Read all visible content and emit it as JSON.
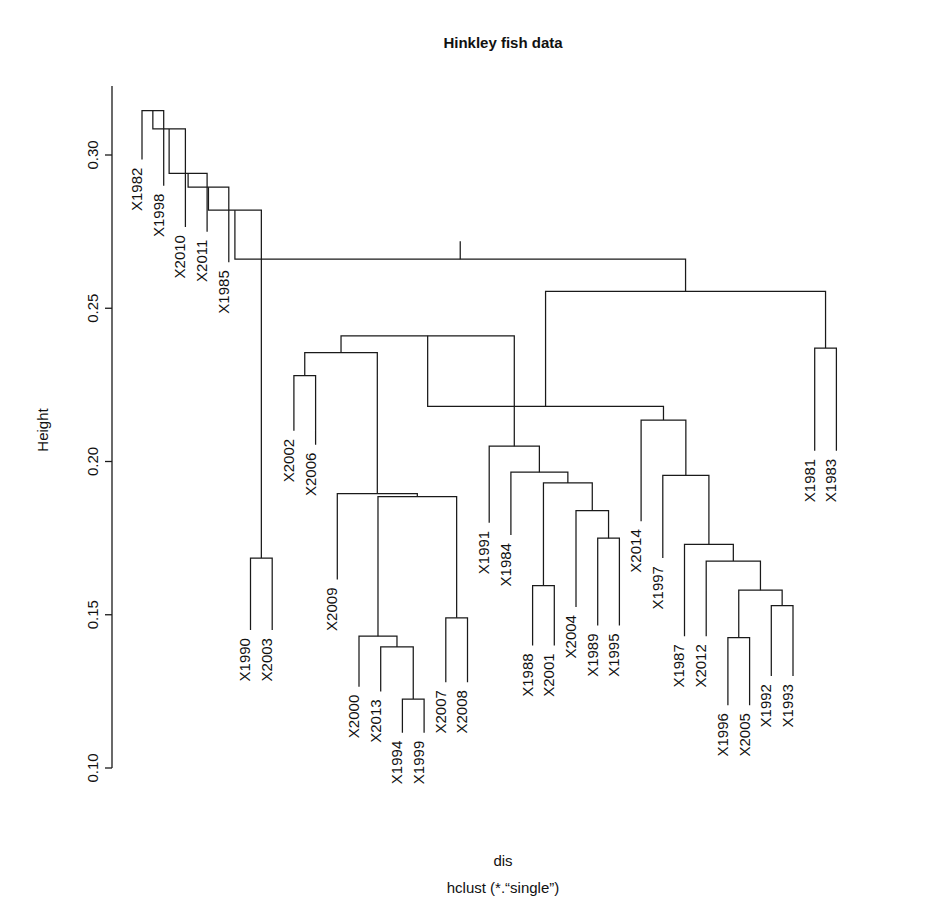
{
  "figure": {
    "title": "Hinkley fish data",
    "ylabel": "Height",
    "caption_line1": "dis",
    "caption_line2": "hclust (*.“single”)",
    "line_color": "#1a1a1a",
    "background": "#ffffff"
  },
  "chart_data": {
    "type": "dendrogram",
    "title": "Hinkley fish data",
    "xlabel": "dis",
    "ylabel": "Height",
    "subtitle": "hclust (*.“single”)",
    "method": "single",
    "distance_object": "dis",
    "grid": false,
    "legend": null,
    "ylim": [
      0.095,
      0.325
    ],
    "yticks": [
      0.1,
      0.15,
      0.2,
      0.25,
      0.3
    ],
    "ytick_labels": [
      "0.10",
      "0.15",
      "0.20",
      "0.25",
      "0.30"
    ],
    "n_leaves": 34,
    "leaf_order": [
      "X1982",
      "X1998",
      "X2010",
      "X2011",
      "X1985",
      "X1990",
      "X2003",
      "X2002",
      "X2006",
      "X2009",
      "X2000",
      "X2013",
      "X1994",
      "X1999",
      "X2007",
      "X2008",
      "X1991",
      "X1984",
      "X1988",
      "X2001",
      "X2004",
      "X1989",
      "X1995",
      "X2014",
      "X1997",
      "X1987",
      "X2012",
      "X1996",
      "X2005",
      "X1992",
      "X1993",
      "X1981",
      "X1983"
    ],
    "leaf_base_height": 0.0,
    "merges": [
      {
        "id": "m1",
        "left": {
          "leaf": "X1982"
        },
        "right": {
          "leaf": "X1998"
        },
        "height": 0.3145
      },
      {
        "id": "m2",
        "left": {
          "node": "m1"
        },
        "right": {
          "leaf": "X2010"
        },
        "height": 0.3085
      },
      {
        "id": "m3",
        "left": {
          "node": "m2"
        },
        "right": {
          "leaf": "X2011"
        },
        "height": 0.294
      },
      {
        "id": "m4",
        "left": {
          "node": "m3"
        },
        "right": {
          "leaf": "X1985"
        },
        "height": 0.2895
      },
      {
        "id": "m5",
        "left": {
          "node": "m4"
        },
        "right": {
          "node": "m6"
        },
        "height": 0.282
      },
      {
        "id": "m6",
        "left": {
          "leaf": "X1990"
        },
        "right": {
          "leaf": "X2003"
        },
        "height": 0.1685
      },
      {
        "id": "m7",
        "left": {
          "leaf": "X2002"
        },
        "right": {
          "leaf": "X2006"
        },
        "height": 0.228
      },
      {
        "id": "m8",
        "left": {
          "node": "m7"
        },
        "right": {
          "node": "m9"
        },
        "height": 0.2355
      },
      {
        "id": "m9",
        "left": {
          "leaf": "X2009"
        },
        "right": {
          "node": "m10"
        },
        "height": 0.1895
      },
      {
        "id": "m10",
        "left": {
          "node": "m11"
        },
        "right": {
          "node": "m14"
        },
        "height": 0.1885
      },
      {
        "id": "m11",
        "left": {
          "leaf": "X2000"
        },
        "right": {
          "node": "m12"
        },
        "height": 0.143
      },
      {
        "id": "m12",
        "left": {
          "leaf": "X2013"
        },
        "right": {
          "node": "m13"
        },
        "height": 0.1395
      },
      {
        "id": "m13",
        "left": {
          "leaf": "X1994"
        },
        "right": {
          "leaf": "X1999"
        },
        "height": 0.1225
      },
      {
        "id": "m14",
        "left": {
          "leaf": "X2007"
        },
        "right": {
          "leaf": "X2008"
        },
        "height": 0.149
      },
      {
        "id": "m15",
        "left": {
          "node": "m8"
        },
        "right": {
          "node": "m16"
        },
        "height": 0.241
      },
      {
        "id": "m16",
        "left": {
          "leaf": "X1991"
        },
        "right": {
          "node": "m17"
        },
        "height": 0.205
      },
      {
        "id": "m17",
        "left": {
          "leaf": "X1984"
        },
        "right": {
          "node": "m18"
        },
        "height": 0.1965
      },
      {
        "id": "m18",
        "left": {
          "node": "m19"
        },
        "right": {
          "node": "m20"
        },
        "height": 0.193
      },
      {
        "id": "m19",
        "left": {
          "leaf": "X1988"
        },
        "right": {
          "leaf": "X2001"
        },
        "height": 0.1595
      },
      {
        "id": "m20",
        "left": {
          "leaf": "X2004"
        },
        "right": {
          "node": "m21"
        },
        "height": 0.184
      },
      {
        "id": "m21",
        "left": {
          "leaf": "X1989"
        },
        "right": {
          "leaf": "X1995"
        },
        "height": 0.175
      },
      {
        "id": "m22",
        "left": {
          "node": "m15"
        },
        "right": {
          "node": "m23"
        },
        "height": 0.218
      },
      {
        "id": "m23",
        "left": {
          "leaf": "X2014"
        },
        "right": {
          "node": "m24"
        },
        "height": 0.2135
      },
      {
        "id": "m24",
        "left": {
          "leaf": "X1997"
        },
        "right": {
          "node": "m25"
        },
        "height": 0.1955
      },
      {
        "id": "m25",
        "left": {
          "leaf": "X1987"
        },
        "right": {
          "node": "m26"
        },
        "height": 0.173
      },
      {
        "id": "m26",
        "left": {
          "leaf": "X2012"
        },
        "right": {
          "node": "m27"
        },
        "height": 0.1675
      },
      {
        "id": "m27",
        "left": {
          "node": "m28"
        },
        "right": {
          "node": "m29"
        },
        "height": 0.158
      },
      {
        "id": "m28",
        "left": {
          "leaf": "X1996"
        },
        "right": {
          "leaf": "X2005"
        },
        "height": 0.1425
      },
      {
        "id": "m29",
        "left": {
          "leaf": "X1992"
        },
        "right": {
          "leaf": "X1993"
        },
        "height": 0.153
      },
      {
        "id": "m30",
        "left": {
          "leaf": "X1981"
        },
        "right": {
          "leaf": "X1983"
        },
        "height": 0.237
      },
      {
        "id": "m31",
        "left": {
          "node": "m22"
        },
        "right": {
          "node": "m30"
        },
        "height": 0.2555
      },
      {
        "id": "m32",
        "left": {
          "node": "m5"
        },
        "right": {
          "node": "m31"
        },
        "height": 0.266
      },
      {
        "id": "m33",
        "left": {
          "node": "m32"
        },
        "right": null,
        "height": 0.266
      }
    ],
    "root": "m32",
    "leaf_heights": {
      "X1982": 0.2985,
      "X1998": 0.29,
      "X2010": 0.2765,
      "X2011": 0.275,
      "X1985": 0.265,
      "X1990": 0.145,
      "X2003": 0.145,
      "X2002": 0.21,
      "X2006": 0.2055,
      "X2009": 0.1615,
      "X2000": 0.1265,
      "X2013": 0.125,
      "X1994": 0.1115,
      "X1999": 0.1115,
      "X2007": 0.128,
      "X2008": 0.128,
      "X1991": 0.18,
      "X1984": 0.176,
      "X1988": 0.14,
      "X2001": 0.14,
      "X2004": 0.1525,
      "X1989": 0.1465,
      "X1995": 0.1465,
      "X2014": 0.1805,
      "X1997": 0.1685,
      "X1987": 0.143,
      "X2012": 0.143,
      "X1996": 0.1205,
      "X2005": 0.1205,
      "X1992": 0.13,
      "X1993": 0.13,
      "X1981": 0.2035,
      "X1983": 0.2035
    }
  },
  "page_footnote": ""
}
